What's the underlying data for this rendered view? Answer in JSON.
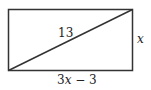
{
  "diagram": {
    "shape": "rectangle",
    "diagonal_label": "13",
    "side_label": "x",
    "bottom_label_coef": "3",
    "bottom_label_var": "x",
    "bottom_label_rest": " − 3",
    "stroke_color": "#333333"
  }
}
